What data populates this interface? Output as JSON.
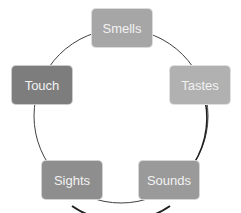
{
  "diagram": {
    "type": "cycle",
    "nodes": [
      {
        "id": "smells",
        "label": "Smells",
        "color": "#a6a6a6",
        "x": 91,
        "y": 8
      },
      {
        "id": "tastes",
        "label": "Tastes",
        "color": "#b1b1b1",
        "x": 169,
        "y": 65
      },
      {
        "id": "sounds",
        "label": "Sounds",
        "color": "#9a9a9a",
        "x": 138,
        "y": 160
      },
      {
        "id": "sights",
        "label": "Sights",
        "color": "#8e8e8e",
        "x": 41,
        "y": 160
      },
      {
        "id": "touch",
        "label": "Touch",
        "color": "#7d7d7d",
        "x": 11,
        "y": 65
      }
    ],
    "ring": {
      "cx": 121,
      "cy": 116,
      "r": 87,
      "stroke": "#404040"
    }
  }
}
